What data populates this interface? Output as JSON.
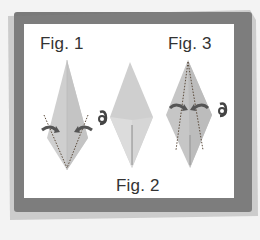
{
  "diagram": {
    "figures": [
      {
        "id": "fig1",
        "label": "Fig. 1"
      },
      {
        "id": "fig2",
        "label": "Fig. 2"
      },
      {
        "id": "fig3",
        "label": "Fig. 3"
      }
    ],
    "colors": {
      "background": "#f3f3f3",
      "frame_brush": "#7a7a7a",
      "panel": "#ffffff",
      "paper_light": "#cfcfcf",
      "paper_dark": "#b8b8b8",
      "arrow": "#555555",
      "fold_line": "#5a4a3a"
    }
  }
}
